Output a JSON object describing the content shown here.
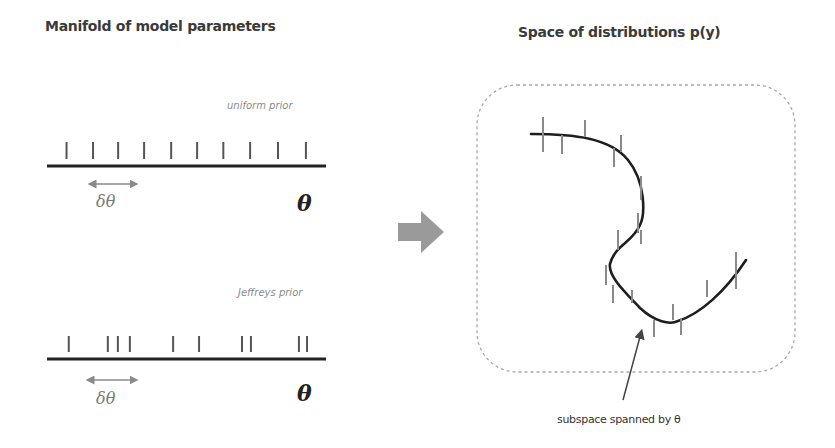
{
  "left_panel": {
    "title": "Manifold of model parameters",
    "uniform": {
      "label": "uniform prior",
      "delta_label": "δθ",
      "axis_label": "θ",
      "tick_positions": [
        0.07,
        0.165,
        0.255,
        0.348,
        0.445,
        0.538,
        0.632,
        0.728,
        0.828,
        0.928
      ]
    },
    "jeffreys": {
      "label": "Jeffreys prior",
      "delta_label": "δθ",
      "axis_label": "θ",
      "tick_positions": [
        0.078,
        0.218,
        0.254,
        0.297,
        0.452,
        0.545,
        0.699,
        0.731,
        0.903,
        0.932
      ]
    }
  },
  "transition_arrow": {
    "icon": "right-arrow-icon",
    "color": "#9a9a9a"
  },
  "right_panel": {
    "title": "Space of distributions p(y)",
    "caption": "subspace spanned by θ",
    "curve_color": "#1e1e1e",
    "tick_color": "#8a8a8a",
    "border_color": "#a0a0a0"
  }
}
